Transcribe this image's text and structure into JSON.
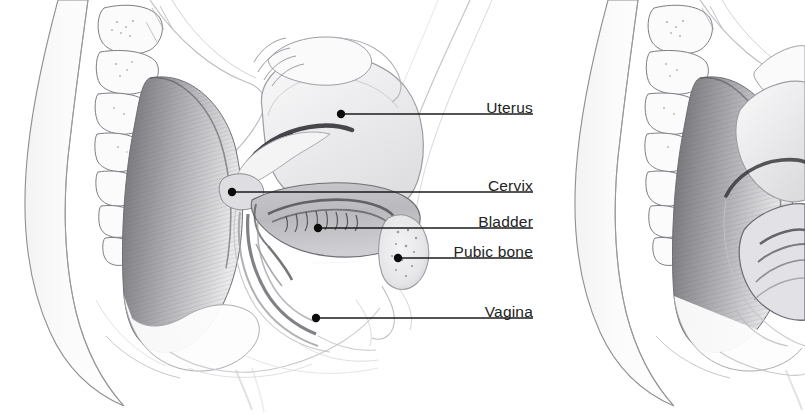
{
  "figure": {
    "background_color": "#ffffff",
    "ink_color": "#232323",
    "line_color": "#1b1b1b",
    "width": 805,
    "height": 414,
    "panels": [
      {
        "name": "left-panel",
        "labeled": true
      },
      {
        "name": "right-panel",
        "labeled": false
      }
    ]
  },
  "labels": [
    {
      "id": "uterus",
      "text": "Uterus",
      "text_x": 533,
      "text_y": 100,
      "dot_x": 341,
      "dot_y": 114,
      "line_x2": 533,
      "line_y": 114
    },
    {
      "id": "cervix",
      "text": "Cervix",
      "text_x": 533,
      "text_y": 178,
      "dot_x": 232,
      "dot_y": 192,
      "line_x2": 533,
      "line_y": 192
    },
    {
      "id": "bladder",
      "text": "Bladder",
      "text_x": 533,
      "text_y": 214,
      "dot_x": 318,
      "dot_y": 228,
      "line_x2": 533,
      "line_y": 228
    },
    {
      "id": "pubic-bone",
      "text": "Pubic bone",
      "text_x": 533,
      "text_y": 244,
      "dot_x": 398,
      "dot_y": 258,
      "line_x2": 533,
      "line_y": 258
    },
    {
      "id": "vagina",
      "text": "Vagina",
      "text_x": 533,
      "text_y": 304,
      "dot_x": 316,
      "dot_y": 318,
      "line_x2": 533,
      "line_y": 318
    }
  ],
  "pointer": {
    "id": "urethra-arrow",
    "kind": "white-arrow",
    "from_x": 358,
    "from_y": 262,
    "to_x": 303,
    "to_y": 263
  },
  "structures": [
    "buttock-contour",
    "sacrum-vertebrae",
    "gluteal-muscle",
    "uterus-body",
    "uterine-cavity",
    "fallopian-tube",
    "cervix",
    "bladder",
    "urethra",
    "pubic-bone",
    "vagina",
    "perineum"
  ]
}
